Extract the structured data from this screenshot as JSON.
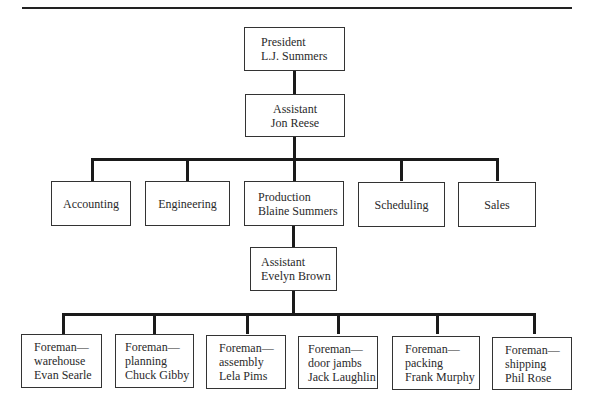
{
  "chart": {
    "president": {
      "title": "President",
      "name": "L.J. Summers"
    },
    "assistant_1": {
      "title": "Assistant",
      "name": "Jon Reese"
    },
    "departments": [
      {
        "label": "Accounting"
      },
      {
        "label": "Engineering"
      },
      {
        "title": "Production",
        "name": "Blaine Summers"
      },
      {
        "label": "Scheduling"
      },
      {
        "label": "Sales"
      }
    ],
    "assistant_2": {
      "title": "Assistant",
      "name": "Evelyn Brown"
    },
    "foremen": [
      {
        "title": "Foreman—",
        "area": "warehouse",
        "name": "Evan Searle"
      },
      {
        "title": "Foreman—",
        "area": "planning",
        "name": "Chuck Gibby"
      },
      {
        "title": "Foreman—",
        "area": "assembly",
        "name": "Lela Pims"
      },
      {
        "title": "Foreman—",
        "area": "door jambs",
        "name": "Jack Laughlin"
      },
      {
        "title": "Foreman—",
        "area": "packing",
        "name": "Frank Murphy"
      },
      {
        "title": "Foreman—",
        "area": "shipping",
        "name": "Phil Rose"
      }
    ]
  }
}
